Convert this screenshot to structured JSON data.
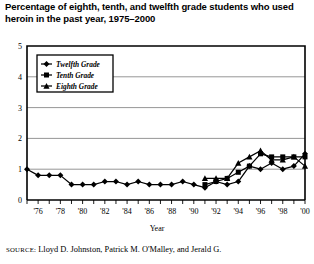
{
  "title": "Percentage of eighth, tenth, and twelfth grade students who used heroin in the past year, 1975–2000",
  "source": {
    "label": "SOURCE:",
    "text": " Lloyd D. Johnston, Patrick M. O'Malley, and Jerald G."
  },
  "chart_data": {
    "type": "line",
    "title": "Percentage of eighth, tenth, and twelfth grade students who used heroin in the past year, 1975–2000",
    "xlabel": "Year",
    "ylabel": "",
    "xlim": [
      1975,
      2000
    ],
    "ylim": [
      0,
      5
    ],
    "yticks": [
      0,
      1,
      2,
      3,
      4,
      5
    ],
    "ytick_labels": [
      "0",
      "1",
      "2",
      "3",
      "4",
      "5"
    ],
    "grid": true,
    "grid_axis": "y",
    "legend_position": "upper-left",
    "x": [
      1975,
      1976,
      1977,
      1978,
      1979,
      1980,
      1981,
      1982,
      1983,
      1984,
      1985,
      1986,
      1987,
      1988,
      1989,
      1990,
      1991,
      1992,
      1993,
      1994,
      1995,
      1996,
      1997,
      1998,
      1999,
      2000
    ],
    "xtick_labels": [
      "'76",
      "'78",
      "'80",
      "'82",
      "'84",
      "'86",
      "'88",
      "'90",
      "'92",
      "'94",
      "'96",
      "'98",
      "'00"
    ],
    "xtick_values": [
      1976,
      1978,
      1980,
      1982,
      1984,
      1986,
      1988,
      1990,
      1992,
      1994,
      1996,
      1998,
      2000
    ],
    "series": [
      {
        "name": "Twelfth Grade",
        "marker": "diamond",
        "color": "#000000",
        "x": [
          1975,
          1976,
          1977,
          1978,
          1979,
          1980,
          1981,
          1982,
          1983,
          1984,
          1985,
          1986,
          1987,
          1988,
          1989,
          1990,
          1991,
          1992,
          1993,
          1994,
          1995,
          1996,
          1997,
          1998,
          1999,
          2000
        ],
        "values": [
          1.0,
          0.8,
          0.8,
          0.8,
          0.5,
          0.5,
          0.5,
          0.6,
          0.6,
          0.5,
          0.6,
          0.5,
          0.5,
          0.5,
          0.6,
          0.5,
          0.4,
          0.6,
          0.5,
          0.6,
          1.1,
          1.0,
          1.2,
          1.0,
          1.1,
          1.5
        ]
      },
      {
        "name": "Tenth Grade",
        "marker": "square",
        "color": "#000000",
        "x": [
          1991,
          1992,
          1993,
          1994,
          1995,
          1996,
          1997,
          1998,
          1999,
          2000
        ],
        "values": [
          0.5,
          0.6,
          0.7,
          0.9,
          1.1,
          1.5,
          1.4,
          1.4,
          1.4,
          1.4
        ]
      },
      {
        "name": "Eighth Grade",
        "marker": "triangle",
        "color": "#000000",
        "x": [
          1991,
          1992,
          1993,
          1994,
          1995,
          1996,
          1997,
          1998,
          1999,
          2000
        ],
        "values": [
          0.7,
          0.7,
          0.7,
          1.2,
          1.4,
          1.6,
          1.3,
          1.3,
          1.4,
          1.1
        ]
      }
    ]
  }
}
